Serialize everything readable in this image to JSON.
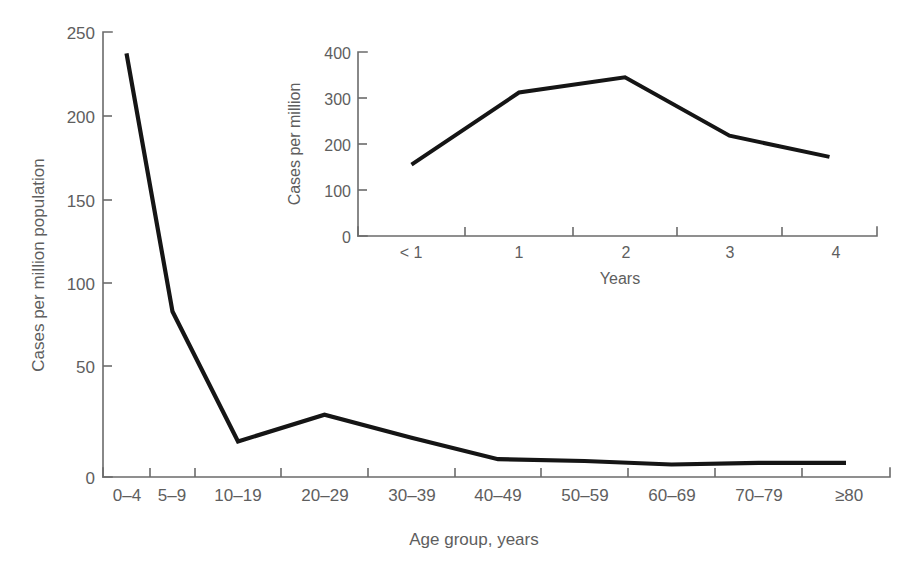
{
  "chart_data": [
    {
      "id": "main",
      "type": "line",
      "title": "",
      "xlabel": "Age group, years",
      "ylabel": "Cases per million population",
      "categories": [
        "0–4",
        "5–9",
        "10–19",
        "20–29",
        "30–39",
        "40–49",
        "50–59",
        "60–69",
        "70–79",
        "≥80"
      ],
      "values": [
        238,
        93,
        20,
        35,
        22,
        10,
        9,
        7,
        8,
        8
      ],
      "ytick_labels": [
        "0",
        "50",
        "100",
        "150",
        "200",
        "250"
      ],
      "ytick_values": [
        0,
        50,
        100,
        150,
        200,
        250
      ],
      "ylim": [
        0,
        250
      ],
      "grid": false,
      "legend": "none"
    },
    {
      "id": "inset",
      "type": "line",
      "title": "",
      "xlabel": "Years",
      "ylabel": "Cases per million",
      "categories": [
        "< 1",
        "1",
        "2",
        "3",
        "4"
      ],
      "values": [
        155,
        312,
        345,
        218,
        172
      ],
      "ytick_labels": [
        "0",
        "100",
        "200",
        "300",
        "400"
      ],
      "ytick_values": [
        0,
        100,
        200,
        300,
        400
      ],
      "ylim": [
        0,
        400
      ],
      "grid": false,
      "legend": "none"
    }
  ],
  "main_chart": {
    "ylabel": "Cases per million population",
    "xlabel": "Age group, years",
    "ytick_0": "0",
    "ytick_1": "50",
    "ytick_2": "100",
    "ytick_3": "150",
    "ytick_4": "200",
    "ytick_5": "250",
    "xtick_0": "0–4",
    "xtick_1": "5–9",
    "xtick_2": "10–19",
    "xtick_3": "20–29",
    "xtick_4": "30–39",
    "xtick_5": "40–49",
    "xtick_6": "50–59",
    "xtick_7": "60–69",
    "xtick_8": "70–79",
    "xtick_9": "≥80"
  },
  "inset_chart": {
    "ylabel": "Cases per million",
    "xlabel": "Years",
    "ytick_0": "0",
    "ytick_1": "100",
    "ytick_2": "200",
    "ytick_3": "300",
    "ytick_4": "400",
    "xtick_0": "< 1",
    "xtick_1": "1",
    "xtick_2": "2",
    "xtick_3": "3",
    "xtick_4": "4"
  },
  "colors": {
    "line": "#151515",
    "axis": "#6b6b6b",
    "text": "#5e5e5e",
    "background": "#ffffff"
  }
}
